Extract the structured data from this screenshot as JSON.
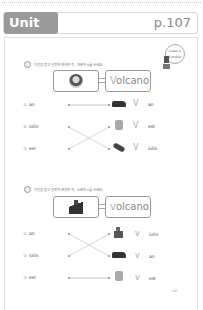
{
  "header": {
    "unit_label": "Unit 22",
    "page_label": "p.107"
  },
  "stamp": {
    "text": "Listen & Connect"
  },
  "sections": [
    {
      "badge": "1",
      "instruction": "다음을 듣고 알맞게 연결한 뒤, 대문자 V를 쓰세요.",
      "example_word_first": "V",
      "example_word_rest": "olcano",
      "rows": [
        {
          "num": "①",
          "left": "an",
          "letter": "V",
          "right": "an",
          "image": "truck-icon"
        },
        {
          "num": "②",
          "left": "iolin",
          "letter": "V",
          "right": "est",
          "image": "vest-icon"
        },
        {
          "num": "③",
          "left": "est",
          "letter": "V",
          "right": "iolin",
          "image": "violin-icon"
        }
      ]
    },
    {
      "badge": "2",
      "instruction": "다음을 듣고 알맞게 연결한 뒤, 소문자 v를 쓰세요.",
      "example_word_first": "v",
      "example_word_rest": "olcano",
      "rows": [
        {
          "num": "①",
          "left": "an",
          "letter": "v",
          "right": "iolin",
          "image": "violinist-icon"
        },
        {
          "num": "②",
          "left": "iolin",
          "letter": "v",
          "right": "an",
          "image": "van-icon"
        },
        {
          "num": "③",
          "left": "est",
          "letter": "v",
          "right": "est",
          "image": "vest-icon"
        }
      ]
    }
  ],
  "footer": {
    "page_number": "107"
  }
}
